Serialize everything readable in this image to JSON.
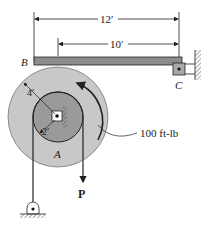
{
  "diagram": {
    "dimensions": {
      "overall": "12′",
      "inner": "10′",
      "outer_radius": "4′",
      "inner_radius": "2′"
    },
    "points": {
      "B": "B",
      "C": "C",
      "A": "A"
    },
    "moment": "100 ft-lb",
    "force": "P",
    "colors": {
      "beam": "#8c8c8c",
      "outer_disk": "#c8c8c8",
      "inner_disk": "#9a9a9a",
      "line": "#222222"
    }
  }
}
